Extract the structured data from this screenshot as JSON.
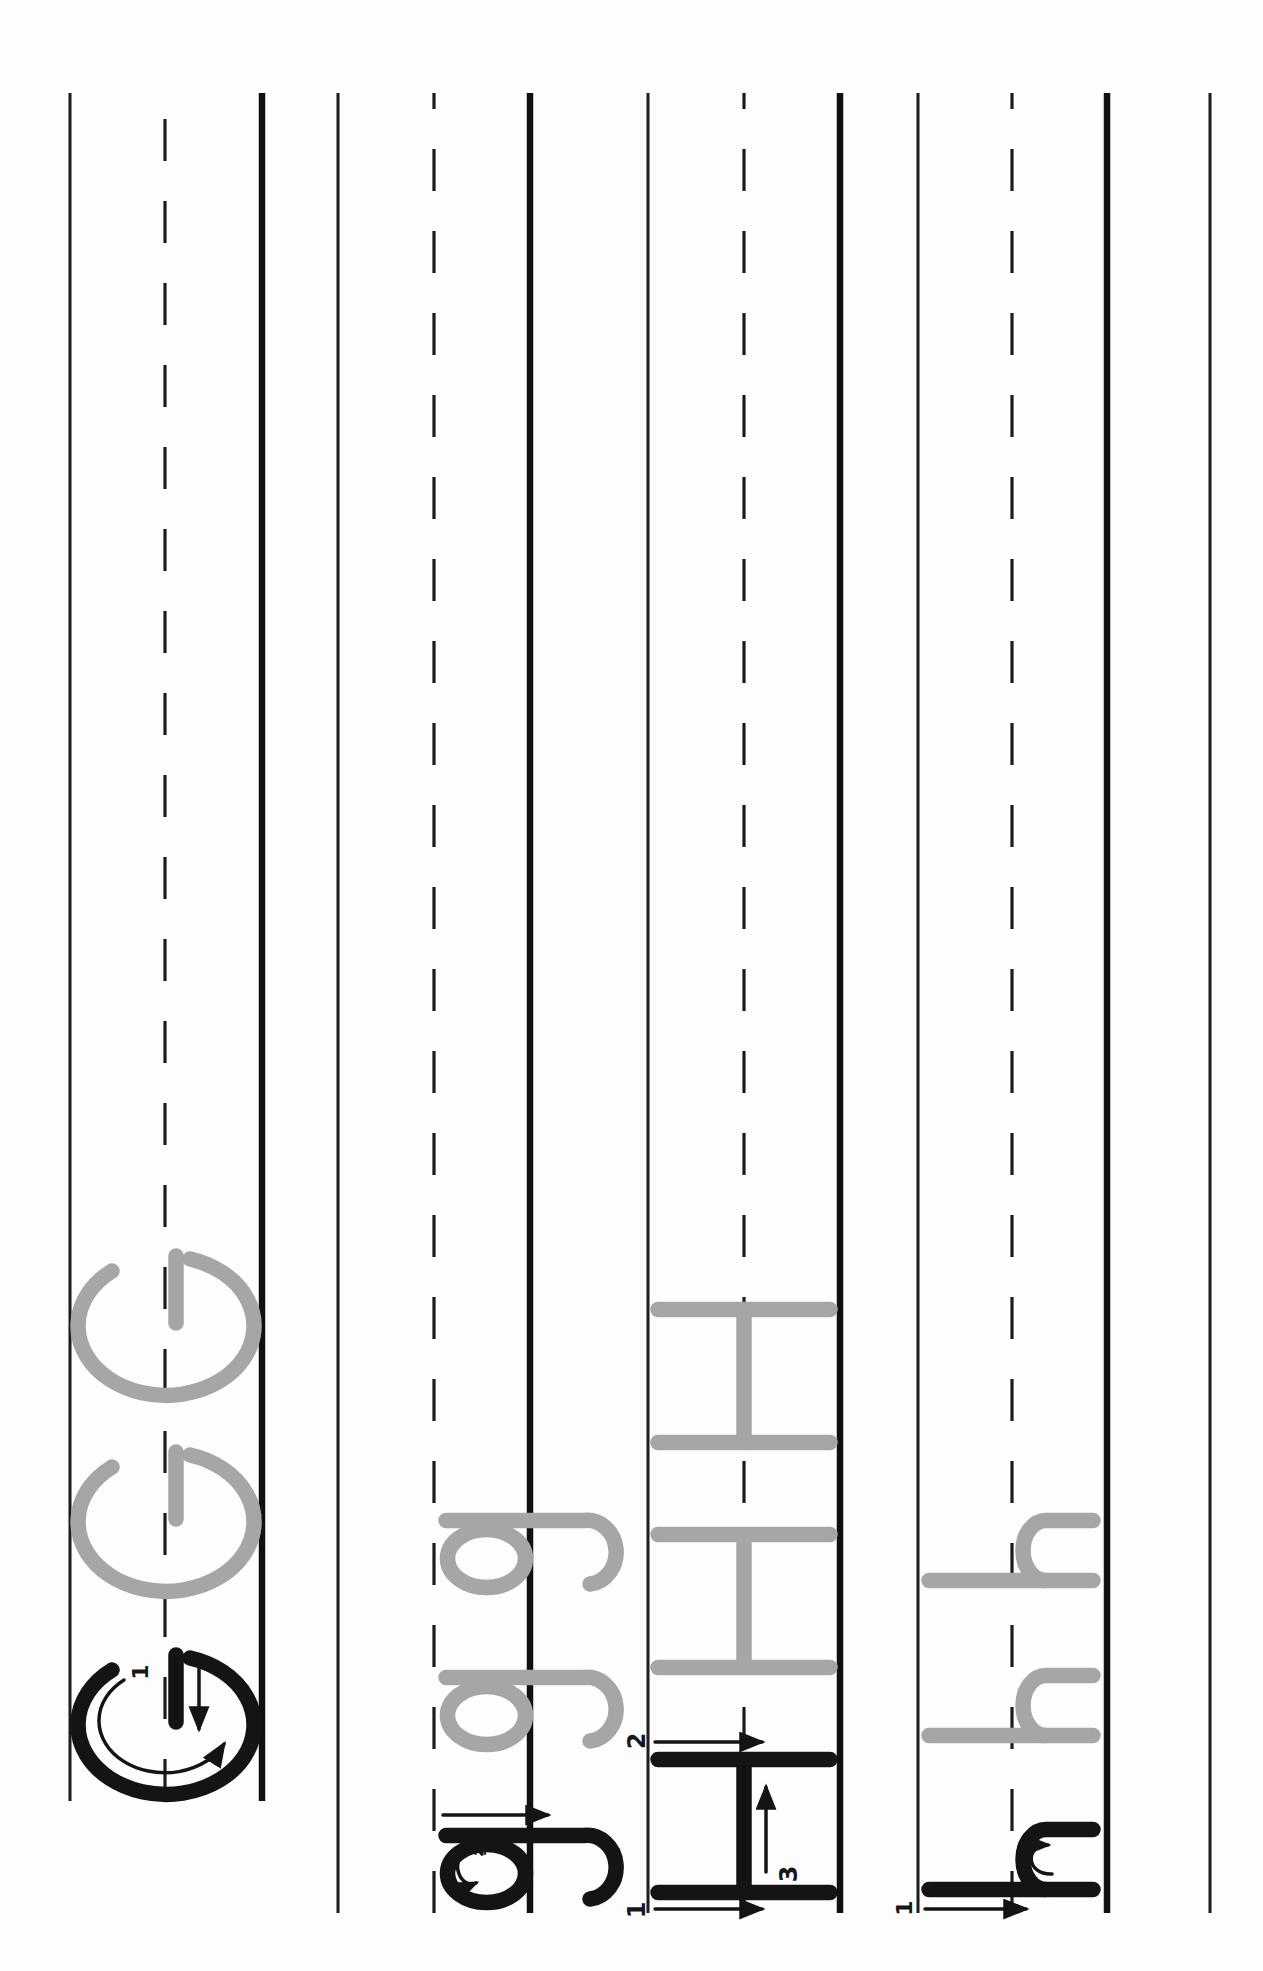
{
  "page": {
    "type": "handwriting-practice-tracing-worksheet",
    "orientation": "page scanned rotated 90 degrees counterclockwise",
    "paper_color": "#fdfdfd",
    "ink_color": "#141414",
    "trace_gray_color": "#a6a6a6",
    "guidelines_per_row": [
      "top-line",
      "dashed-midline",
      "thick-baseline"
    ]
  },
  "rows": [
    {
      "id": "row-uppercase-G",
      "example_letter": "G",
      "stroke_labels": [
        "1"
      ],
      "trace_letters": [
        "G",
        "G"
      ]
    },
    {
      "id": "row-lowercase-g",
      "example_letter": "g",
      "stroke_labels": [
        "1"
      ],
      "trace_letters": [
        "g",
        "g"
      ]
    },
    {
      "id": "row-uppercase-H",
      "example_letter": "H",
      "stroke_labels": [
        "1",
        "2",
        "3"
      ],
      "trace_letters": [
        "H",
        "H"
      ]
    },
    {
      "id": "row-lowercase-h",
      "example_letter": "h",
      "stroke_labels": [
        "1"
      ],
      "trace_letters": [
        "h",
        "h"
      ]
    }
  ]
}
